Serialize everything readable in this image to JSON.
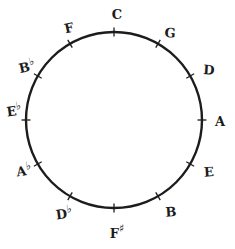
{
  "diagram": {
    "type": "circle-of-fifths",
    "background_color": "#ffffff",
    "stroke_color": "#1c1c1c",
    "circle": {
      "cx": 114,
      "cy": 120,
      "r": 88,
      "stroke_width": 2.4
    },
    "notes": [
      {
        "id": "C",
        "letter": "C",
        "accidental": "",
        "label": "C",
        "angle_deg": 0,
        "label_x": 117,
        "label_y": 14,
        "tilt": "tilt-f"
      },
      {
        "id": "G",
        "letter": "G",
        "accidental": "",
        "label": "G",
        "angle_deg": 30,
        "label_x": 170,
        "label_y": 33,
        "tilt": "tilt-d"
      },
      {
        "id": "D",
        "letter": "D",
        "accidental": "",
        "label": "D",
        "angle_deg": 60,
        "label_x": 209,
        "label_y": 70,
        "tilt": "tilt-d"
      },
      {
        "id": "A",
        "letter": "A",
        "accidental": "",
        "label": "A",
        "angle_deg": 90,
        "label_x": 220,
        "label_y": 121,
        "tilt": "tilt-f"
      },
      {
        "id": "E",
        "letter": "E",
        "accidental": "",
        "label": "E",
        "angle_deg": 120,
        "label_x": 209,
        "label_y": 172,
        "tilt": "tilt-c"
      },
      {
        "id": "B",
        "letter": "B",
        "accidental": "",
        "label": "B",
        "angle_deg": 150,
        "label_x": 171,
        "label_y": 212,
        "tilt": "tilt-c"
      },
      {
        "id": "Fs",
        "letter": "F",
        "accidental": "♯",
        "label": "F♯",
        "angle_deg": 180,
        "label_x": 117,
        "label_y": 233,
        "tilt": "tilt-f"
      },
      {
        "id": "Db",
        "letter": "D",
        "accidental": "♭",
        "label": "D♭",
        "angle_deg": 210,
        "label_x": 64,
        "label_y": 214,
        "tilt": "tilt-b"
      },
      {
        "id": "Ab",
        "letter": "A",
        "accidental": "♭",
        "label": "A♭",
        "angle_deg": 240,
        "label_x": 24,
        "label_y": 171,
        "tilt": "tilt-b"
      },
      {
        "id": "Eb",
        "letter": "E",
        "accidental": "♭",
        "label": "E♭",
        "angle_deg": 270,
        "label_x": 14,
        "label_y": 111,
        "tilt": "tilt-b"
      },
      {
        "id": "Bb",
        "letter": "B",
        "accidental": "♭",
        "label": "B♭",
        "angle_deg": 300,
        "label_x": 27,
        "label_y": 67,
        "tilt": "tilt-a"
      },
      {
        "id": "F",
        "letter": "F",
        "accidental": "",
        "label": "F",
        "angle_deg": 330,
        "label_x": 69,
        "label_y": 28,
        "tilt": "tilt-a"
      }
    ]
  }
}
